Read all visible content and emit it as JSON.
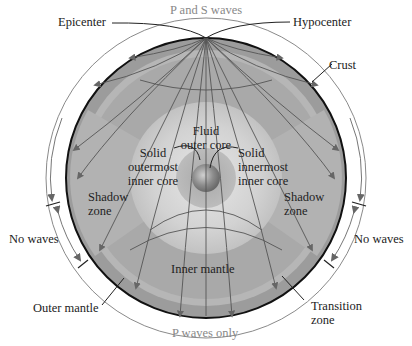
{
  "diagram": {
    "labels": {
      "epicenter": "Epicenter",
      "p_and_s_waves": "P and S waves",
      "hypocenter": "Hypocenter",
      "crust": "Crust",
      "fluid_outer_core_1": "Fluid",
      "fluid_outer_core_2": "outer core",
      "solid_outermost_1": "Solid",
      "solid_outermost_2": "outermost",
      "solid_outermost_3": "inner core",
      "solid_innermost_1": "Solid",
      "solid_innermost_2": "innermost",
      "solid_innermost_3": "inner core",
      "shadow_zone_left_1": "Shadow",
      "shadow_zone_left_2": "zone",
      "shadow_zone_right_1": "Shadow",
      "shadow_zone_right_2": "zone",
      "no_waves_left": "No waves",
      "no_waves_right": "No waves",
      "inner_mantle": "Inner mantle",
      "outer_mantle": "Outer mantle",
      "transition_zone_1": "Transition",
      "transition_zone_2": "zone",
      "p_waves_only": "P waves only"
    },
    "colors": {
      "mantle_outer": "#9a9a9a",
      "transition_band": "#b4b4b4",
      "mantle_inner": "#a8a8a8",
      "outer_core": "#d6d6d6",
      "inner_core": "#8a8a8a",
      "ray": "#555555",
      "label": "#222222",
      "gray_label": "#888888"
    }
  }
}
